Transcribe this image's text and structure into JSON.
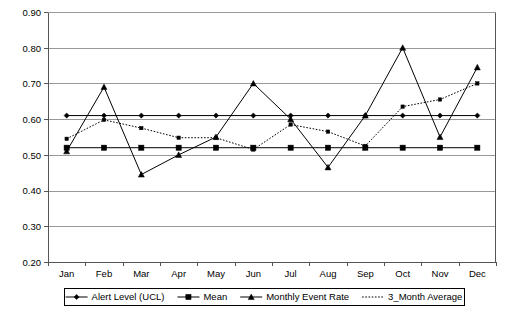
{
  "chart_data": {
    "type": "line",
    "title": "",
    "xlabel": "",
    "ylabel": "",
    "ylim": [
      0.2,
      0.9
    ],
    "ytick_step": 0.1,
    "grid": true,
    "legend_position": "bottom",
    "categories": [
      "Jan",
      "Feb",
      "Mar",
      "Apr",
      "May",
      "Jun",
      "Jul",
      "Aug",
      "Sep",
      "Oct",
      "Nov",
      "Dec"
    ],
    "ytick_labels": [
      "0.90",
      "0.80",
      "0.70",
      "0.60",
      "0.50",
      "0.40",
      "0.30",
      "0.20"
    ],
    "ytick_values": [
      0.9,
      0.8,
      0.7,
      0.6,
      0.5,
      0.4,
      0.3,
      0.2
    ],
    "series": [
      {
        "name": "Alert Level (UCL)",
        "marker": "diamond",
        "style": "solid",
        "color": "#000000",
        "values": [
          0.61,
          0.61,
          0.61,
          0.61,
          0.61,
          0.61,
          0.61,
          0.61,
          0.61,
          0.61,
          0.61,
          0.61
        ]
      },
      {
        "name": "Mean",
        "marker": "square",
        "style": "solid",
        "color": "#000000",
        "values": [
          0.52,
          0.52,
          0.52,
          0.52,
          0.52,
          0.52,
          0.52,
          0.52,
          0.52,
          0.52,
          0.52,
          0.52
        ]
      },
      {
        "name": "Monthly Event Rate",
        "marker": "triangle",
        "style": "solid",
        "color": "#000000",
        "values": [
          0.51,
          0.69,
          0.445,
          0.5,
          0.55,
          0.7,
          0.6,
          0.465,
          0.61,
          0.8,
          0.55,
          0.745
        ]
      },
      {
        "name": "3_Month Average",
        "marker": "small-square",
        "style": "dotted",
        "color": "#000000",
        "values": [
          0.545,
          0.598,
          0.575,
          0.548,
          0.548,
          0.515,
          0.585,
          0.565,
          0.525,
          0.635,
          0.655,
          0.7
        ]
      }
    ]
  },
  "legend": {
    "entries": [
      {
        "label": "Alert Level (UCL)",
        "marker": "diamond",
        "style": "solid"
      },
      {
        "label": "Mean",
        "marker": "square",
        "style": "solid"
      },
      {
        "label": "Monthly Event Rate",
        "marker": "triangle",
        "style": "solid"
      },
      {
        "label": "3_Month Average",
        "marker": "none",
        "style": "dotted"
      }
    ]
  }
}
